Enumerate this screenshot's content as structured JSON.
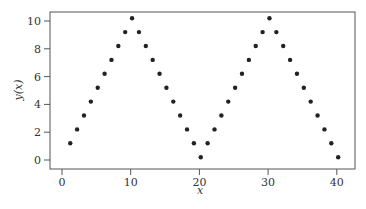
{
  "chart_data": {
    "type": "scatter",
    "title": "",
    "xlabel": "x",
    "ylabel": "y(x)",
    "xlim": [
      -2,
      42.5
    ],
    "ylim": [
      -0.7,
      10.6
    ],
    "xticks": [
      0,
      10,
      20,
      30,
      40
    ],
    "yticks": [
      0,
      2,
      4,
      6,
      8,
      10
    ],
    "grid": false,
    "legend": null,
    "marker_color": "#222222",
    "series": [
      {
        "name": "y(x)",
        "x": [
          1.2,
          2.2,
          3.2,
          4.2,
          5.2,
          6.2,
          7.2,
          8.2,
          9.2,
          10.2,
          11.2,
          12.2,
          13.2,
          14.2,
          15.2,
          16.2,
          17.2,
          18.2,
          19.2,
          20.2,
          21.2,
          22.2,
          23.2,
          24.2,
          25.2,
          26.2,
          27.2,
          28.2,
          29.2,
          30.2,
          31.2,
          32.2,
          33.2,
          34.2,
          35.2,
          36.2,
          37.2,
          38.2,
          39.2,
          40.2
        ],
        "y": [
          1.2,
          2.2,
          3.2,
          4.2,
          5.2,
          6.2,
          7.2,
          8.2,
          9.2,
          10.2,
          9.2,
          8.2,
          7.2,
          6.2,
          5.2,
          4.2,
          3.2,
          2.2,
          1.2,
          0.2,
          1.2,
          2.2,
          3.2,
          4.2,
          5.2,
          6.2,
          7.2,
          8.2,
          9.2,
          10.2,
          9.2,
          8.2,
          7.2,
          6.2,
          5.2,
          4.2,
          3.2,
          2.2,
          1.2,
          0.2
        ]
      }
    ]
  }
}
